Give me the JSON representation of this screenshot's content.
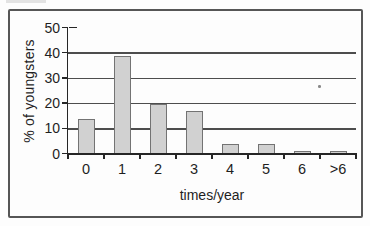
{
  "figure": {
    "frame_color": "#565656",
    "background": "#fdfdfd"
  },
  "chart_data": {
    "type": "bar",
    "title": "",
    "categories": [
      "0",
      "1",
      "2",
      "3",
      "4",
      "5",
      "6",
      ">6"
    ],
    "values": [
      14,
      39,
      20,
      17,
      4,
      4,
      1,
      1
    ],
    "xlabel": "times/year",
    "ylabel": "% of youngsters",
    "ylim": [
      0,
      50
    ],
    "yticks": [
      0,
      10,
      20,
      30,
      40,
      50
    ],
    "grid": "horizontal",
    "legend_position": "none",
    "bar_fill": "#d1d1d1",
    "bar_border": "#737373",
    "gridline_color": "#4d4d4d",
    "axis_color": "#262626",
    "text_color": "#1f1f1f"
  }
}
